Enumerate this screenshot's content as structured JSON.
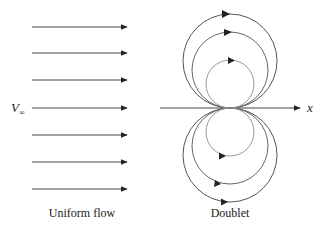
{
  "diagram": {
    "uniform_flow": {
      "caption": "Uniform flow",
      "velocity_label": "V",
      "velocity_subscript": "∞",
      "arrow_count": 7,
      "arrow_y": [
        27,
        53,
        80,
        108,
        135,
        162,
        189
      ],
      "arrow_x_start": 32,
      "arrow_x_end": 128
    },
    "doublet": {
      "caption": "Doublet",
      "axis_label": "x",
      "origin": [
        230,
        108
      ],
      "radii": [
        24,
        38,
        47
      ],
      "stroke_color": "#555555"
    },
    "colors": {
      "line": "#444444",
      "text": "#222222"
    }
  }
}
